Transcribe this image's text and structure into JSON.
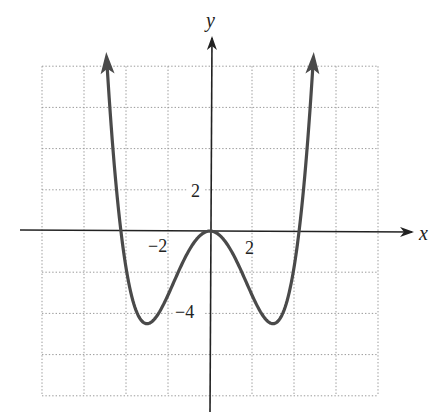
{
  "chart_data": {
    "type": "line",
    "title": "",
    "xlabel": "x",
    "ylabel": "y",
    "xlim": [
      -8,
      8
    ],
    "ylim": [
      -8,
      8
    ],
    "grid": true,
    "grid_step": 2,
    "legend": null,
    "function": "f(x) = x^4/18 - x^2 (approximate fit)",
    "x_tick_labels": [
      {
        "value": -2,
        "label": "−2"
      },
      {
        "value": 2,
        "label": "2"
      }
    ],
    "y_tick_labels": [
      {
        "value": 2,
        "label": "2"
      },
      {
        "value": -4,
        "label": "−4"
      }
    ],
    "key_points": {
      "local_max": [
        0,
        0
      ],
      "local_minima": [
        [
          -3,
          -4.5
        ],
        [
          3,
          -4.5
        ]
      ],
      "x_intercepts": [
        -4.24,
        0,
        4.24
      ]
    },
    "series": [
      {
        "name": "f(x)",
        "color": "#4a4a4a",
        "x": [
          -4.9,
          -4.5,
          -4.24,
          -4,
          -3.5,
          -3,
          -2.5,
          -2,
          -1.5,
          -1,
          -0.5,
          0,
          0.5,
          1,
          1.5,
          2,
          2.5,
          3,
          3.5,
          4,
          4.24,
          4.5,
          4.9
        ],
        "y": [
          7.0,
          2.53,
          0.0,
          -1.78,
          -3.91,
          -4.5,
          -4.08,
          -3.11,
          -1.97,
          -0.94,
          -0.25,
          0,
          -0.25,
          -0.94,
          -1.97,
          -3.11,
          -4.08,
          -4.5,
          -3.91,
          -1.78,
          0.0,
          2.53,
          7.0
        ],
        "arrows": "both ends point upward"
      }
    ]
  },
  "labels": {
    "x_axis": "x",
    "y_axis": "y",
    "x_neg2": "−2",
    "x_pos2": "2",
    "y_pos2": "2",
    "y_neg4": "−4"
  },
  "colors": {
    "curve": "#4a4a4a",
    "axis": "#222222",
    "grid": "#9a9a9a"
  }
}
